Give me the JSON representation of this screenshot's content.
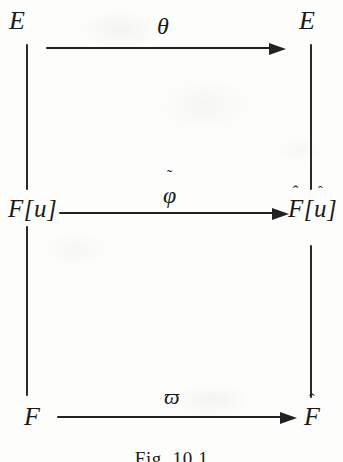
{
  "figure": {
    "caption": "Fig. 10.1",
    "ink_color": "#222222",
    "background_color": "#fdfdfb"
  },
  "nodes": {
    "top_left": {
      "label": "E"
    },
    "top_right": {
      "base": "E",
      "accent": "ˆ"
    },
    "mid_left": {
      "label": "F[u]"
    },
    "mid_right": {
      "f_base": "F",
      "f_accent": "ˆ",
      "open": "[",
      "u_base": "u",
      "u_accent": "ˆ",
      "close": "]"
    },
    "bottom_left": {
      "label": "F"
    },
    "bottom_right": {
      "base": "F",
      "accent": "ˆ"
    }
  },
  "arrows": {
    "top": {
      "label": "θ",
      "direction": "right"
    },
    "middle": {
      "base": "φ",
      "accent": "˜",
      "direction": "right"
    },
    "bottom": {
      "label": "ϖ",
      "direction": "right"
    }
  },
  "connectors": {
    "left_upper": "vertical-line",
    "right_upper": "vertical-line",
    "left_lower": "vertical-line",
    "right_lower": "vertical-line"
  }
}
